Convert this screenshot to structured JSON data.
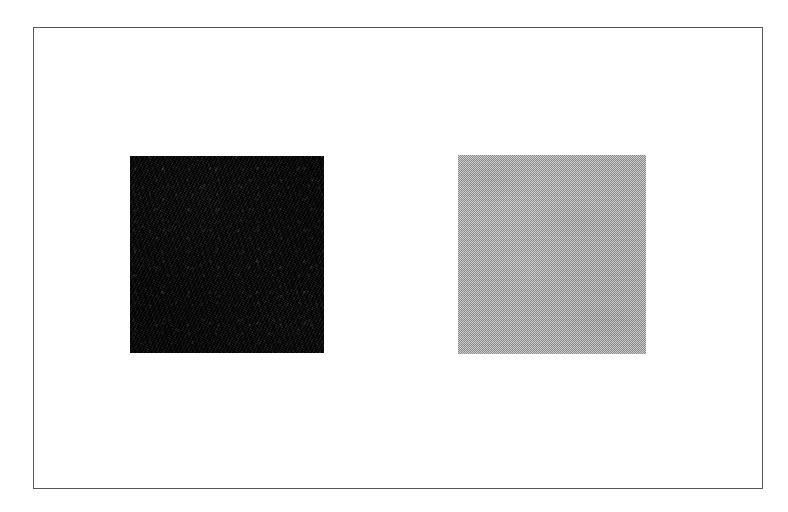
{
  "figure": {
    "canvas": {
      "width_px": 788,
      "height_px": 512,
      "background_color": "#ffffff"
    },
    "frame": {
      "name": "outer border rectangle",
      "stroke_color": "#565656",
      "stroke_width_px": 1,
      "left_px": 33,
      "top_px": 27,
      "width_px": 730,
      "height_px": 462
    }
  },
  "patches": [
    {
      "id": "dark",
      "label": "dark patch",
      "position": "left",
      "fill_color": "#171717",
      "tone": "near-black",
      "texture": "mottled grain",
      "left_px": 130,
      "top_px": 156,
      "width_px": 194,
      "height_px": 197
    },
    {
      "id": "light",
      "label": "light patch",
      "position": "right",
      "fill_color": "#a9a9a9",
      "tone": "light gray",
      "texture": "checkerboard halftone dither",
      "left_px": 458,
      "top_px": 155,
      "width_px": 188,
      "height_px": 199
    }
  ],
  "chart_data": {
    "type": "heatmap",
    "subtitle": "",
    "xlabel": "",
    "ylabel": "",
    "categories": [
      "dark patch",
      "light patch"
    ],
    "values": [
      23,
      169
    ],
    "value_unit": "8-bit luminance",
    "ylim": [
      0,
      255
    ],
    "grid": false,
    "legend": "none",
    "annotations": []
  }
}
